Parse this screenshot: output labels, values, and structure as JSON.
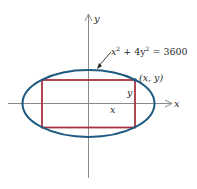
{
  "diagram": {
    "type": "ellipse-inscribed-rectangle",
    "axes": {
      "x_label": "x",
      "y_label": "y"
    },
    "ellipse": {
      "equation_x": "x",
      "equation_mid": " + 4y",
      "equation_rhs": " = 3600",
      "equation_full": "x² + 4y² = 3600",
      "color": "#1f5a80"
    },
    "rectangle": {
      "color": "#a8343f",
      "width_label": "x",
      "height_label": "y"
    },
    "point_label": "(x, y)",
    "axis_color": "#8a8a8a"
  }
}
